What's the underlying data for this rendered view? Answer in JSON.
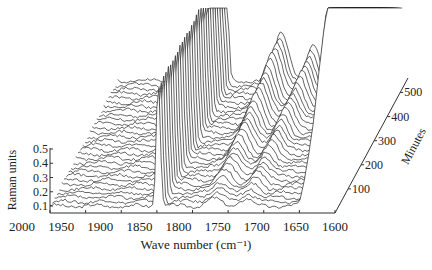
{
  "chart_data": {
    "type": "waterfall-3d-line",
    "title": "",
    "xlabel": "Wave number (cm⁻¹)",
    "ylabel": "Raman units",
    "zlabel": "Minutes",
    "x_ticks": [
      "2000",
      "1950",
      "1900",
      "1850",
      "1800",
      "1750",
      "1700",
      "1650",
      "1600"
    ],
    "y_ticks": [
      "0.1",
      "0.2",
      "0.3",
      "0.4",
      "0.5"
    ],
    "z_ticks": [
      "100",
      "200",
      "300",
      "400",
      "500"
    ],
    "xlim": [
      2000,
      1600
    ],
    "ylim": [
      0.05,
      0.5
    ],
    "zlim": [
      0,
      560
    ],
    "num_traces": 30,
    "peaks": [
      {
        "center": 1848,
        "width": 4,
        "height_start": 0.9,
        "height_end": 0.9,
        "note": "sharp constant peak"
      },
      {
        "center": 1770,
        "width": 14,
        "height_start": 0.05,
        "height_end": 0.35,
        "note": "growing band"
      },
      {
        "center": 1725,
        "width": 12,
        "height_start": 0.05,
        "height_end": 0.25,
        "note": "growing band"
      },
      {
        "center": 1610,
        "width": 20,
        "height_start": 0.6,
        "height_end": 1.4,
        "note": "strong rising edge, clipped"
      }
    ],
    "series_description": "Stacked Raman spectra recorded over time (0-560 min), offset diagonally along the Minutes axis"
  },
  "axes": {
    "x_label": "Wave number (cm⁻¹)",
    "y_label": "Raman units",
    "z_label": "Minutes"
  }
}
